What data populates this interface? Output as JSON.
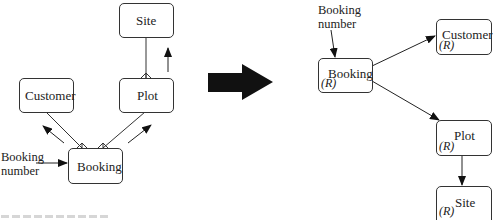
{
  "left_diagram": {
    "entities": [
      {
        "id": "site",
        "label": "Site"
      },
      {
        "id": "customer",
        "label": "Customer"
      },
      {
        "id": "plot",
        "label": "Plot"
      },
      {
        "id": "booking",
        "label": "Booking"
      }
    ],
    "key_label_line1": "Booking",
    "key_label_line2": "number",
    "relationships": [
      {
        "from": "booking",
        "to": "customer",
        "notation": "crow's foot at Booking",
        "access_arrow": "up-left"
      },
      {
        "from": "booking",
        "to": "plot",
        "notation": "crow's foot at Booking",
        "access_arrow": "up-right"
      },
      {
        "from": "plot",
        "to": "site",
        "notation": "crow's foot at Plot",
        "access_arrow": "up"
      }
    ]
  },
  "transform_arrow": "block-arrow-right",
  "right_diagram": {
    "entities": [
      {
        "id": "booking",
        "label": "Booking",
        "tag": "(R)"
      },
      {
        "id": "customer",
        "label": "Customer",
        "tag": "(R)"
      },
      {
        "id": "plot",
        "label": "Plot",
        "tag": "(R)"
      },
      {
        "id": "site",
        "label": "Site",
        "tag": "(R)"
      }
    ],
    "key_label_line1": "Booking",
    "key_label_line2": "number",
    "edges": [
      {
        "from": "booking_number",
        "to": "booking"
      },
      {
        "from": "booking",
        "to": "customer"
      },
      {
        "from": "booking",
        "to": "plot"
      },
      {
        "from": "plot",
        "to": "site"
      }
    ]
  },
  "colors": {
    "line": "#333333",
    "arrow_fill": "#111111",
    "background": "#ffffff"
  }
}
